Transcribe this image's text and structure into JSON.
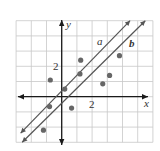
{
  "chart_data": {
    "type": "scatter",
    "title": "",
    "xlabel": "x",
    "ylabel": "y",
    "xlim": [
      -3,
      6
    ],
    "ylim": [
      -3,
      5
    ],
    "grid": true,
    "tick_labels": {
      "x": [
        "2"
      ],
      "y": [
        "2"
      ]
    },
    "points": [
      {
        "x": -0.75,
        "y": 1.1
      },
      {
        "x": 1.25,
        "y": 2.4
      },
      {
        "x": 1.2,
        "y": 1.5
      },
      {
        "x": 0.2,
        "y": 0.5
      },
      {
        "x": -0.8,
        "y": -0.65
      },
      {
        "x": 0.65,
        "y": -0.75
      },
      {
        "x": -1.2,
        "y": -2.2
      },
      {
        "x": 2.7,
        "y": 0.85
      },
      {
        "x": 3.15,
        "y": 1.4
      },
      {
        "x": 3.8,
        "y": 2.7
      }
    ],
    "lines": [
      {
        "name": "a",
        "x1": -2.7,
        "y1": -2.4,
        "x2": 4.5,
        "y2": 5.0
      },
      {
        "name": "b",
        "x1": -2.6,
        "y1": -3.0,
        "x2": 5.5,
        "y2": 5.0
      }
    ]
  },
  "labels": {
    "x_axis": "x",
    "y_axis": "y",
    "x_tick": "2",
    "y_tick": "2",
    "line_a": "a",
    "line_b": "b"
  },
  "colors": {
    "grid": "#c8c8c8",
    "axis": "#1a1a1a",
    "line": "#555555",
    "point": "#666666"
  }
}
